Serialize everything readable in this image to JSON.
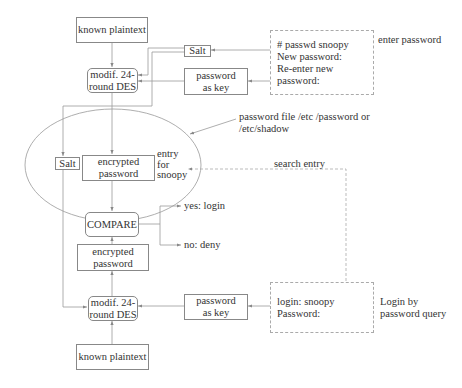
{
  "diagram": {
    "top": {
      "known_plaintext": "known plaintext",
      "salt": "Salt",
      "des": [
        "modif. 24-",
        "round DES"
      ],
      "password_as_key": [
        "password",
        "as key"
      ],
      "terminal": [
        "# passwd snoopy",
        "New password:",
        "Re-enter new password:"
      ],
      "terminal_caption": "enter password"
    },
    "password_file": {
      "salt": "Salt",
      "encrypted_password": [
        "encrypted",
        "password"
      ],
      "entry_label": [
        "entry",
        "for",
        "snoopy"
      ],
      "caption": [
        "password file /etc /password or",
        "/etc/shadow"
      ],
      "search_entry": "search entry"
    },
    "compare": {
      "label": "COMPARE",
      "yes": "yes: login",
      "no": "no: deny"
    },
    "bottom": {
      "encrypted_password": [
        "encrypted",
        "password"
      ],
      "des": [
        "modif. 24-",
        "round DES"
      ],
      "password_as_key": [
        "password",
        "as key"
      ],
      "known_plaintext": "known plaintext",
      "terminal": [
        "login: snoopy",
        "Password:"
      ],
      "terminal_caption": [
        "Login by",
        "password query"
      ]
    }
  }
}
